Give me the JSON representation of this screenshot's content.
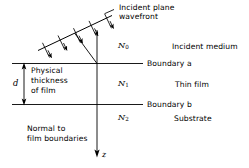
{
  "figure": {
    "ink_color": "#000000",
    "background_color": "#ffffff"
  },
  "annotations": {
    "incident_wavefront_line1": "Incident plane",
    "incident_wavefront_line2": "wavefront",
    "incident_medium": "Incident medium",
    "boundary_a": "Boundary a",
    "thin_film": "Thin film",
    "boundary_b": "Boundary b",
    "substrate": "Substrate",
    "normal_line1": "Normal to",
    "normal_line2": "film boundaries"
  },
  "indices": {
    "n0_symbol": "N",
    "n0_subscript": "0",
    "n1_symbol": "N",
    "n1_subscript": "1",
    "n2_symbol": "N",
    "n2_subscript": "2"
  },
  "thickness": {
    "symbol": "d",
    "caption_line1": "Physical",
    "caption_line2": "thickness",
    "caption_line3": "of film"
  },
  "axis": {
    "z_label": "z"
  }
}
